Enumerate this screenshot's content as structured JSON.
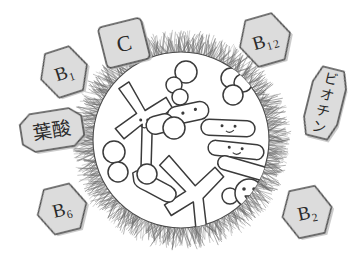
{
  "illustration": {
    "title": "Vitamins defending an immune cell",
    "background_color": "#ffffff",
    "ink_color": "#3a3a3a",
    "badge_fill": "#dcdcdc",
    "badge_stroke": "#4a4a4a",
    "cell": {
      "name": "immune-cell",
      "membrane_style": "hairy-radial-fringe",
      "membrane_color": "#555555",
      "interior_fill": "#ffffff",
      "center_x": 181,
      "center_y": 140,
      "radius": 92
    },
    "badges": [
      {
        "id": "b1",
        "label": "B₁",
        "label_plain": "B1",
        "shape": "hexagon",
        "x": 64,
        "y": 72,
        "rotation": -18,
        "width": 48,
        "height": 46,
        "font_size": 19
      },
      {
        "id": "c",
        "label": "C",
        "label_plain": "C",
        "shape": "rounded-square",
        "x": 124,
        "y": 43,
        "rotation": -14,
        "width": 44,
        "height": 42,
        "font_size": 22
      },
      {
        "id": "b12",
        "label": "B₁₂",
        "label_plain": "B12",
        "shape": "hexagon",
        "x": 265,
        "y": 40,
        "rotation": -16,
        "width": 52,
        "height": 48,
        "font_size": 19
      },
      {
        "id": "biotin",
        "label": "ビオチン",
        "label_plain": "biotin",
        "shape": "octagon-vertical",
        "x": 325,
        "y": 103,
        "rotation": 14,
        "width": 34,
        "height": 70,
        "font_size": 14,
        "writing_mode": "vertical"
      },
      {
        "id": "folic-acid",
        "label": "葉酸",
        "label_plain": "folic acid",
        "shape": "octagon",
        "x": 52,
        "y": 130,
        "rotation": -9,
        "width": 62,
        "height": 38,
        "font_size": 19
      },
      {
        "id": "b6",
        "label": "B₆",
        "label_plain": "B6",
        "shape": "hexagon",
        "x": 62,
        "y": 209,
        "rotation": -14,
        "width": 50,
        "height": 46,
        "font_size": 19
      },
      {
        "id": "b2",
        "label": "B₂",
        "label_plain": "B2",
        "shape": "hexagon",
        "x": 307,
        "y": 212,
        "rotation": -12,
        "width": 50,
        "height": 48,
        "font_size": 19
      }
    ],
    "antibodies": [
      {
        "id": "antibody-upper-left",
        "x": 141,
        "y": 118,
        "rotation": 8,
        "scale": 1.0,
        "has_face": true
      },
      {
        "id": "antibody-lower-center",
        "x": 192,
        "y": 197,
        "rotation": -4,
        "scale": 1.05,
        "has_face": false
      }
    ],
    "bacteria": [
      {
        "id": "bacterium-top-center",
        "x": 188,
        "y": 113,
        "rotation": -12,
        "length": 42,
        "thickness": 17,
        "has_face": true,
        "face": "two-dots"
      },
      {
        "id": "bacterium-right-upper",
        "x": 228,
        "y": 128,
        "rotation": 2,
        "length": 54,
        "thickness": 15,
        "has_face": true,
        "face": "smile"
      },
      {
        "id": "bacterium-right-middle",
        "x": 236,
        "y": 150,
        "rotation": 6,
        "length": 56,
        "thickness": 14,
        "has_face": true,
        "face": "smile"
      },
      {
        "id": "bacterium-right-lower",
        "x": 243,
        "y": 168,
        "rotation": 16,
        "length": 52,
        "thickness": 14,
        "has_face": false,
        "face": "none"
      },
      {
        "id": "bacterium-lower-left",
        "x": 153,
        "y": 186,
        "rotation": 28,
        "length": 46,
        "thickness": 16,
        "has_face": false,
        "face": "none"
      }
    ],
    "cells_round": [
      {
        "id": "cell-top-cluster-a",
        "cx": 186,
        "cy": 72,
        "r": 11
      },
      {
        "id": "cell-top-cluster-b",
        "cx": 174,
        "cy": 85,
        "r": 8
      },
      {
        "id": "cell-top-cluster-c",
        "cx": 180,
        "cy": 97,
        "r": 8
      },
      {
        "id": "cell-top-right-a",
        "cx": 231,
        "cy": 78,
        "r": 10
      },
      {
        "id": "cell-top-right-b",
        "cx": 243,
        "cy": 83,
        "r": 9
      },
      {
        "id": "cell-top-right-c",
        "cx": 233,
        "cy": 95,
        "r": 10
      },
      {
        "id": "cell-left-edge-a",
        "cx": 114,
        "cy": 152,
        "r": 11
      },
      {
        "id": "cell-left-edge-b",
        "cx": 118,
        "cy": 172,
        "r": 10
      },
      {
        "id": "cell-interior-free",
        "cx": 147,
        "cy": 174,
        "r": 10
      },
      {
        "id": "cell-mid-left",
        "cx": 174,
        "cy": 128,
        "r": 11
      },
      {
        "id": "cell-face-lower-right-head",
        "cx": 249,
        "cy": 193,
        "r": 14,
        "has_face": true
      },
      {
        "id": "cell-face-lower-right-lobe",
        "cx": 230,
        "cy": 196,
        "r": 8,
        "has_face": false
      }
    ]
  }
}
